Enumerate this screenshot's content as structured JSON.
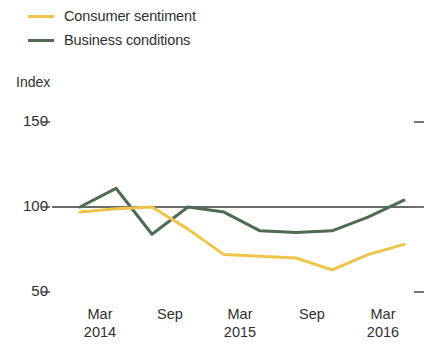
{
  "chart_data": {
    "type": "line",
    "title": "",
    "subtitle": "",
    "ylabel": "Index",
    "xlabel": "",
    "ylim": [
      50,
      150
    ],
    "yticks": [
      50,
      100,
      150
    ],
    "ytick_labels": [
      "50",
      "100",
      "150"
    ],
    "grid": false,
    "reference_line": 100,
    "legend_position": "top-left",
    "x": [
      "Mar 2014",
      "Jun 2014",
      "Sep 2014",
      "Dec 2014",
      "Mar 2015",
      "Jun 2015",
      "Sep 2015",
      "Dec 2015",
      "Mar 2016",
      "Jun 2016"
    ],
    "xtick_labels": [
      {
        "month": "Mar",
        "year": "2014"
      },
      {
        "month": "Sep",
        "year": ""
      },
      {
        "month": "Mar",
        "year": "2015"
      },
      {
        "month": "Sep",
        "year": ""
      },
      {
        "month": "Mar",
        "year": "2016"
      }
    ],
    "series": [
      {
        "name": "Consumer sentiment",
        "color": "#EFC44A",
        "values": [
          97,
          99,
          100,
          87,
          72,
          71,
          70,
          63,
          72,
          78
        ]
      },
      {
        "name": "Business conditions",
        "color": "#4F6B52",
        "values": [
          100,
          111,
          84,
          100,
          97,
          86,
          85,
          86,
          94,
          104
        ]
      }
    ]
  },
  "legend": {
    "items": [
      {
        "label": "Consumer sentiment",
        "color": "#EFC44A"
      },
      {
        "label": "Business conditions",
        "color": "#4F6B52"
      }
    ]
  },
  "axes": {
    "y_title": "Index",
    "y_labels": [
      "150",
      "100",
      "50"
    ],
    "x_labels": [
      {
        "month": "Mar",
        "year": "2014"
      },
      {
        "month": "Sep",
        "year": ""
      },
      {
        "month": "Mar",
        "year": "2015"
      },
      {
        "month": "Sep",
        "year": ""
      },
      {
        "month": "Mar",
        "year": "2016"
      }
    ]
  }
}
